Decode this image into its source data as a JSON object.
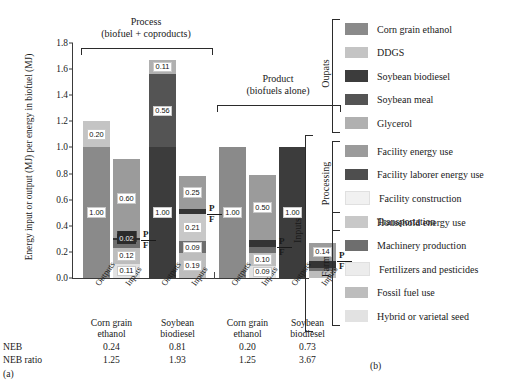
{
  "figure": {
    "panel_a_label": "(a)",
    "panel_b_label": "(b)",
    "ylabel": "Energy input or output (MJ) per energy in biofuel (MJ)",
    "yticks": [
      "0.0",
      "0.2",
      "0.4",
      "0.6",
      "0.8",
      "1.0",
      "1.2",
      "1.4",
      "1.6",
      "1.8"
    ],
    "headers": [
      {
        "line1": "Process",
        "line2": "(biofuel + coproducts)"
      },
      {
        "line1": "Product",
        "line2": "(biofuels alone)"
      }
    ],
    "axis_pair_labels": [
      "Outputs",
      "Inputs"
    ],
    "group_labels": [
      {
        "line1": "Corn grain",
        "line2": "ethanol"
      },
      {
        "line1": "Soybean",
        "line2": "biodiesel"
      },
      {
        "line1": "Corn grain",
        "line2": "ethanol"
      },
      {
        "line1": "Soybean",
        "line2": "biodiesel"
      }
    ],
    "neb_row_label": "NEB",
    "neb_ratio_row_label": "NEB ratio",
    "neb_values": [
      "0.24",
      "0.81",
      "0.20",
      "0.73"
    ],
    "neb_ratio_values": [
      "1.25",
      "1.93",
      "1.25",
      "3.67"
    ],
    "pf_labels": {
      "processing": "P",
      "farm": "F"
    }
  },
  "colors": {
    "corn_grain_ethanol": "#8a8a8a",
    "ddgs": "#c4c4c4",
    "soybean_biodiesel": "#3c3c3c",
    "soybean_meal": "#545454",
    "glycerol": "#b0b0b0",
    "facility_energy_use": "#9b9b9b",
    "facility_laborer_energy_use": "#4e4e4e",
    "facility_construction": "#f1f1f1",
    "transportation": "#343434",
    "household_energy_use": "#c8c8c8",
    "machinery_production": "#6e6e6e",
    "fertilizers_and_pesticides": "#ececec",
    "fossil_fuel_use": "#bdbdbd",
    "hybrid_or_varietal_seed": "#e2e2e2",
    "axis": "#3a3a3a"
  },
  "legend": {
    "categories": [
      {
        "name": "Oupats",
        "display": "Oupats"
      },
      {
        "name": "Inputs",
        "display": "Inputs"
      },
      {
        "name": "Processing",
        "display": "Processing"
      },
      {
        "name": "Farm",
        "display": "Farm"
      }
    ],
    "outputs": [
      {
        "label": "Corn grain ethanol",
        "color_key": "corn_grain_ethanol"
      },
      {
        "label": "DDGS",
        "color_key": "ddgs"
      },
      {
        "label": "Soybean biodiesel",
        "color_key": "soybean_biodiesel"
      },
      {
        "label": "Soybean meal",
        "color_key": "soybean_meal"
      },
      {
        "label": "Glycerol",
        "color_key": "glycerol"
      }
    ],
    "processing": [
      {
        "label": "Facility energy use",
        "color_key": "facility_energy_use"
      },
      {
        "label": "Facility laborer energy use",
        "color_key": "facility_laborer_energy_use"
      },
      {
        "label": "Facility construction",
        "color_key": "facility_construction"
      },
      {
        "label": "Transportation",
        "color_key": "transportation"
      }
    ],
    "farm": [
      {
        "label": "Household energy use",
        "color_key": "household_energy_use"
      },
      {
        "label": "Machinery production",
        "color_key": "machinery_production"
      },
      {
        "label": "Fertilizers and pesticides",
        "color_key": "fertilizers_and_pesticides"
      },
      {
        "label": "Fossil fuel use",
        "color_key": "fossil_fuel_use"
      },
      {
        "label": "Hybrid or varietal seed",
        "color_key": "hybrid_or_varietal_seed"
      }
    ]
  },
  "chart_data": {
    "type": "bar",
    "title": "",
    "xlabel": "",
    "ylabel": "Energy input or output (MJ) per energy in biofuel (MJ)",
    "ylim": [
      0,
      1.8
    ],
    "ytick_step": 0.2,
    "grid": false,
    "stacked": true,
    "legend_position": "right",
    "panels": [
      {
        "header": "Process (biofuel + coproducts)",
        "groups": [
          {
            "name": "Corn grain ethanol",
            "neb": 0.24,
            "neb_ratio": 1.25,
            "bars": [
              {
                "name": "Outputs",
                "total": 1.2,
                "segments": [
                  {
                    "label": "Corn grain ethanol",
                    "value": 1.0,
                    "shown_label": "1.00",
                    "color_key": "corn_grain_ethanol"
                  },
                  {
                    "label": "DDGS",
                    "value": 0.2,
                    "shown_label": "0.20",
                    "color_key": "ddgs"
                  }
                ]
              },
              {
                "name": "Inputs",
                "total": 0.96,
                "segments": [
                  {
                    "label": "Hybrid or varietal seed",
                    "value": 0.11,
                    "shown_label": "0.11",
                    "color_key": "hybrid_or_varietal_seed"
                  },
                  {
                    "label": "Fossil fuel use",
                    "value": 0.12,
                    "shown_label": "0.12",
                    "color_key": "fossil_fuel_use"
                  },
                  {
                    "label": "Machinery production",
                    "value": 0.06,
                    "shown_label": "0.06",
                    "color_key": "machinery_production"
                  },
                  {
                    "label": "Transportation",
                    "value": 0.02,
                    "shown_label": "0.02",
                    "color_key": "transportation"
                  },
                  {
                    "label": "Facility energy use",
                    "value": 0.6,
                    "shown_label": "0.60",
                    "color_key": "facility_energy_use"
                  }
                ],
                "pf_divider_after": "Machinery production"
              }
            ]
          },
          {
            "name": "Soybean biodiesel",
            "neb": 0.81,
            "neb_ratio": 1.93,
            "bars": [
              {
                "name": "Outputs",
                "total": 1.67,
                "segments": [
                  {
                    "label": "Soybean biodiesel",
                    "value": 1.0,
                    "shown_label": "1.00",
                    "color_key": "soybean_biodiesel"
                  },
                  {
                    "label": "Soybean meal",
                    "value": 0.56,
                    "shown_label": "0.56",
                    "color_key": "soybean_meal"
                  },
                  {
                    "label": "Glycerol",
                    "value": 0.11,
                    "shown_label": "0.11",
                    "color_key": "glycerol"
                  }
                ]
              },
              {
                "name": "Inputs",
                "total": 0.86,
                "segments": [
                  {
                    "label": "Fossil fuel use",
                    "value": 0.19,
                    "shown_label": "0.19",
                    "color_key": "fossil_fuel_use"
                  },
                  {
                    "label": "Machinery production",
                    "value": 0.09,
                    "shown_label": "0.09",
                    "color_key": "machinery_production"
                  },
                  {
                    "label": "Household energy use",
                    "value": 0.21,
                    "shown_label": "0.21",
                    "color_key": "household_energy_use"
                  },
                  {
                    "label": "Transportation",
                    "value": 0.04,
                    "shown_label": "",
                    "color_key": "transportation"
                  },
                  {
                    "label": "Facility energy use",
                    "value": 0.25,
                    "shown_label": "0.25",
                    "color_key": "facility_energy_use"
                  }
                ],
                "pf_divider_after": "Household energy use"
              }
            ]
          }
        ]
      },
      {
        "header": "Product (biofuels alone)",
        "groups": [
          {
            "name": "Corn grain ethanol",
            "neb": 0.2,
            "neb_ratio": 1.25,
            "bars": [
              {
                "name": "Outputs",
                "total": 1.0,
                "segments": [
                  {
                    "label": "Corn grain ethanol",
                    "value": 1.0,
                    "shown_label": "1.00",
                    "color_key": "corn_grain_ethanol"
                  }
                ]
              },
              {
                "name": "Inputs",
                "total": 0.79,
                "segments": [
                  {
                    "label": "Hybrid or varietal seed",
                    "value": 0.09,
                    "shown_label": "0.09",
                    "color_key": "hybrid_or_varietal_seed"
                  },
                  {
                    "label": "Fossil fuel use",
                    "value": 0.1,
                    "shown_label": "0.10",
                    "color_key": "fossil_fuel_use"
                  },
                  {
                    "label": "Machinery production",
                    "value": 0.05,
                    "shown_label": "",
                    "color_key": "machinery_production"
                  },
                  {
                    "label": "Transportation",
                    "value": 0.05,
                    "shown_label": "",
                    "color_key": "transportation"
                  },
                  {
                    "label": "Facility energy use",
                    "value": 0.5,
                    "shown_label": "0.50",
                    "color_key": "facility_energy_use"
                  }
                ],
                "pf_divider_after": "Machinery production"
              }
            ]
          },
          {
            "name": "Soybean biodiesel",
            "neb": 0.73,
            "neb_ratio": 3.67,
            "bars": [
              {
                "name": "Outputs",
                "total": 1.0,
                "segments": [
                  {
                    "label": "Soybean biodiesel",
                    "value": 1.0,
                    "shown_label": "1.00",
                    "color_key": "soybean_biodiesel"
                  }
                ]
              },
              {
                "name": "Inputs",
                "total": 0.27,
                "segments": [
                  {
                    "label": "Fossil fuel use",
                    "value": 0.05,
                    "shown_label": "",
                    "color_key": "fossil_fuel_use"
                  },
                  {
                    "label": "Machinery production",
                    "value": 0.03,
                    "shown_label": "",
                    "color_key": "machinery_production"
                  },
                  {
                    "label": "Transportation",
                    "value": 0.05,
                    "shown_label": "",
                    "color_key": "transportation"
                  },
                  {
                    "label": "Facility energy use",
                    "value": 0.14,
                    "shown_label": "0.14",
                    "color_key": "facility_energy_use"
                  }
                ],
                "pf_divider_after": "Transportation"
              }
            ]
          }
        ]
      }
    ]
  }
}
